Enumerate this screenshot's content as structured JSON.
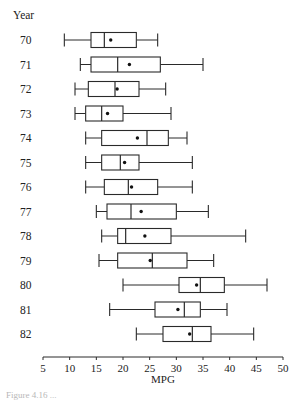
{
  "chart_data": {
    "type": "boxplot",
    "orientation": "horizontal",
    "title": "",
    "ylabel": "Year",
    "xlabel": "MPG",
    "xlim": [
      5,
      50
    ],
    "xticks": [
      5,
      10,
      15,
      20,
      25,
      30,
      35,
      40,
      45,
      50
    ],
    "grid": false,
    "legend": null,
    "mean_marker": "dot",
    "categories": [
      "70",
      "71",
      "72",
      "73",
      "74",
      "75",
      "76",
      "77",
      "78",
      "79",
      "80",
      "81",
      "82"
    ],
    "series": [
      {
        "year": "70",
        "min": 9,
        "q1": 14,
        "median": 16.5,
        "q3": 22.5,
        "max": 26.5,
        "mean": 17.7
      },
      {
        "year": "71",
        "min": 12,
        "q1": 14,
        "median": 19,
        "q3": 27,
        "max": 35,
        "mean": 21.2
      },
      {
        "year": "72",
        "min": 11,
        "q1": 13.5,
        "median": 18.5,
        "q3": 23,
        "max": 28,
        "mean": 18.9
      },
      {
        "year": "73",
        "min": 11,
        "q1": 13,
        "median": 16,
        "q3": 20,
        "max": 29,
        "mean": 17.1
      },
      {
        "year": "74",
        "min": 13,
        "q1": 16,
        "median": 24.5,
        "q3": 28.5,
        "max": 32,
        "mean": 22.7
      },
      {
        "year": "75",
        "min": 13,
        "q1": 16,
        "median": 19.5,
        "q3": 23,
        "max": 33,
        "mean": 20.3
      },
      {
        "year": "76",
        "min": 13,
        "q1": 16.5,
        "median": 21,
        "q3": 26.5,
        "max": 33,
        "mean": 21.6
      },
      {
        "year": "77",
        "min": 15,
        "q1": 17,
        "median": 21.5,
        "q3": 30,
        "max": 36,
        "mean": 23.4
      },
      {
        "year": "78",
        "min": 16,
        "q1": 19,
        "median": 20.5,
        "q3": 29,
        "max": 43,
        "mean": 24.1
      },
      {
        "year": "79",
        "min": 15.5,
        "q1": 19,
        "median": 25.5,
        "q3": 32,
        "max": 37,
        "mean": 25.1
      },
      {
        "year": "80",
        "min": 20,
        "q1": 30.5,
        "median": 34.5,
        "q3": 39,
        "max": 47,
        "mean": 33.8
      },
      {
        "year": "81",
        "min": 17.5,
        "q1": 26,
        "median": 31.5,
        "q3": 34.5,
        "max": 39.5,
        "mean": 30.3
      },
      {
        "year": "82",
        "min": 22.5,
        "q1": 27.5,
        "median": 33,
        "q3": 36.5,
        "max": 44.5,
        "mean": 32.5
      }
    ]
  },
  "axis": {
    "y_title": "Year",
    "x_title": "MPG"
  },
  "caption": {
    "text": "Figure 4.16 ..."
  }
}
